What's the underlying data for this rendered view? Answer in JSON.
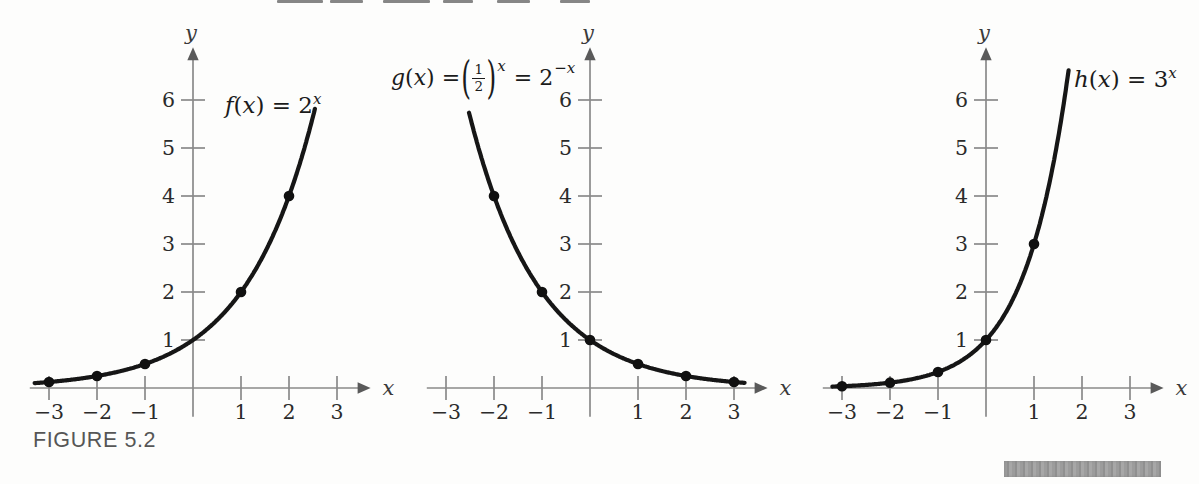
{
  "figure": {
    "caption": "FIGURE 5.2"
  },
  "labels": {
    "f": {
      "name": "f",
      "open": "(",
      "var": "x",
      "close": ") = 2",
      "exp": "x"
    },
    "g": {
      "name": "g",
      "open": "(",
      "var": "x",
      "eq1": ") =",
      "lparen": "(",
      "num": "1",
      "den": "2",
      "rparen": ")",
      "exp1": "x",
      "eq2": "= 2",
      "exp2": "−x"
    },
    "h": {
      "name": "h",
      "open": "(",
      "var": "x",
      "close": ") = 3",
      "exp": "x"
    }
  },
  "colors": {
    "curve_ink": "#161616",
    "axis_gray": "#8a8a8a",
    "caption_gray": "#565656",
    "highlight_bar_gray": "#9c9c9c"
  },
  "chart_data": {
    "type": "line",
    "figure_label": "FIGURE 5.2",
    "panels": [
      {
        "id": "f",
        "formula": "f(x) = 2^x",
        "base": 2,
        "curve_domain": [
          -3.3,
          2.55
        ],
        "y_clip": 7.0,
        "points": [
          [
            -3,
            0.125
          ],
          [
            -2,
            0.25
          ],
          [
            -1,
            0.5
          ],
          [
            1,
            2
          ],
          [
            2,
            4
          ]
        ],
        "x_ticks": [
          {
            "v": -3,
            "label": "−3"
          },
          {
            "v": -2,
            "label": "−2"
          },
          {
            "v": -1,
            "label": "−1"
          },
          {
            "v": 1,
            "label": "1"
          },
          {
            "v": 2,
            "label": "2"
          },
          {
            "v": 3,
            "label": "3"
          }
        ],
        "y_ticks": [
          {
            "v": 1,
            "label": "1"
          },
          {
            "v": 2,
            "label": "2"
          },
          {
            "v": 3,
            "label": "3"
          },
          {
            "v": 4,
            "label": "4"
          },
          {
            "v": 5,
            "label": "5"
          },
          {
            "v": 6,
            "label": "6"
          }
        ],
        "xlim": [
          -3.4,
          3.7
        ],
        "ylim": [
          -0.6,
          7.1
        ],
        "xlabel": "x",
        "ylabel": "y",
        "grid": false
      },
      {
        "id": "g",
        "formula": "g(x) = (1/2)^x = 2^-x",
        "base": 0.5,
        "curve_domain": [
          -2.52,
          3.22
        ],
        "y_clip": 7.0,
        "points": [
          [
            -2,
            4
          ],
          [
            -1,
            2
          ],
          [
            0,
            1
          ],
          [
            1,
            0.5
          ],
          [
            2,
            0.25
          ],
          [
            3,
            0.125
          ]
        ],
        "x_ticks": [
          {
            "v": -3,
            "label": "−3"
          },
          {
            "v": -2,
            "label": "−2"
          },
          {
            "v": -1,
            "label": "−1"
          },
          {
            "v": 1,
            "label": "1"
          },
          {
            "v": 2,
            "label": "2"
          },
          {
            "v": 3,
            "label": "3"
          }
        ],
        "y_ticks": [
          {
            "v": 1,
            "label": "1"
          },
          {
            "v": 2,
            "label": "2"
          },
          {
            "v": 3,
            "label": "3"
          },
          {
            "v": 4,
            "label": "4"
          },
          {
            "v": 5,
            "label": "5"
          },
          {
            "v": 6,
            "label": "6"
          }
        ],
        "xlim": [
          -3.4,
          3.7
        ],
        "ylim": [
          -0.6,
          7.1
        ],
        "xlabel": "x",
        "ylabel": "y",
        "grid": false
      },
      {
        "id": "h",
        "formula": "h(x) = 3^x",
        "base": 3,
        "curve_domain": [
          -3.2,
          1.733
        ],
        "y_clip": 6.72,
        "points": [
          [
            -3,
            0.037
          ],
          [
            -2,
            0.111
          ],
          [
            -1,
            0.333
          ],
          [
            0,
            1
          ],
          [
            1,
            3
          ]
        ],
        "x_ticks": [
          {
            "v": -3,
            "label": "−3"
          },
          {
            "v": -2,
            "label": "−2"
          },
          {
            "v": -1,
            "label": "−1"
          },
          {
            "v": 1,
            "label": "1"
          },
          {
            "v": 2,
            "label": "2"
          },
          {
            "v": 3,
            "label": "3"
          }
        ],
        "y_ticks": [
          {
            "v": 1,
            "label": "1"
          },
          {
            "v": 2,
            "label": "2"
          },
          {
            "v": 3,
            "label": "3"
          },
          {
            "v": 4,
            "label": "4"
          },
          {
            "v": 5,
            "label": "5"
          },
          {
            "v": 6,
            "label": "6"
          }
        ],
        "xlim": [
          -3.4,
          3.7
        ],
        "ylim": [
          -0.6,
          7.1
        ],
        "xlabel": "x",
        "ylabel": "y",
        "grid": false
      }
    ]
  },
  "artifacts": {
    "top_cropped_text_segments": [
      [
        277,
        46
      ],
      [
        330,
        33
      ],
      [
        383,
        47
      ],
      [
        443,
        30
      ],
      [
        497,
        33
      ],
      [
        560,
        30
      ]
    ]
  }
}
